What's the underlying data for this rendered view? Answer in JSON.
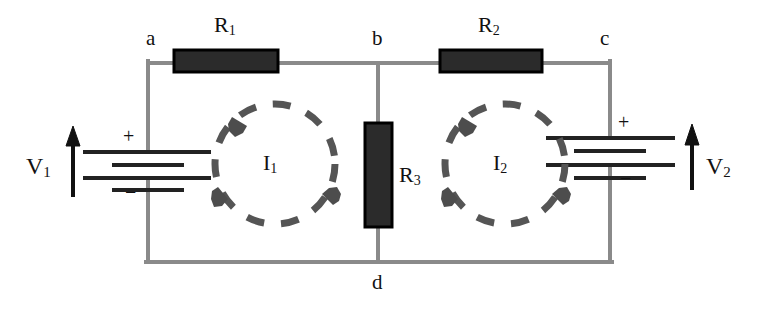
{
  "diagram": {
    "type": "circuit-schematic",
    "width": 762,
    "height": 316,
    "colors": {
      "background": "#ffffff",
      "wire": "#8a8a8a",
      "resistor_fill": "#262626",
      "resistor_stroke": "#000000",
      "loop_arrow": "#555555",
      "text": "#111111",
      "battery_plate": "#222222"
    }
  },
  "nodes": [
    {
      "id": "a",
      "label": "a",
      "x": 146,
      "y": 28
    },
    {
      "id": "b",
      "label": "b",
      "x": 372,
      "y": 28
    },
    {
      "id": "c",
      "label": "c",
      "x": 600,
      "y": 28
    },
    {
      "id": "d",
      "label": "d",
      "x": 372,
      "y": 272
    }
  ],
  "resistors": [
    {
      "id": "R1",
      "label": "R",
      "subscript": "1",
      "orientation": "horizontal",
      "x": 174,
      "y": 50,
      "w": 104,
      "h": 22,
      "label_x": 214,
      "label_y": 14
    },
    {
      "id": "R2",
      "label": "R",
      "subscript": "2",
      "orientation": "horizontal",
      "x": 440,
      "y": 50,
      "w": 102,
      "h": 22,
      "label_x": 478,
      "label_y": 14
    },
    {
      "id": "R3",
      "label": "R",
      "subscript": "3",
      "orientation": "vertical",
      "x": 365,
      "y": 123,
      "w": 27,
      "h": 104,
      "label_x": 399,
      "label_y": 164
    }
  ],
  "sources": [
    {
      "id": "V1",
      "label": "V",
      "subscript": "1",
      "plus": "+",
      "minus": "−",
      "label_x": 26,
      "label_y": 154,
      "arrow_x": 73,
      "arrow_top": 130,
      "arrow_bottom": 197,
      "plus_x": 123,
      "plus_y": 128,
      "minus_x": 125,
      "minus_y": 182,
      "terminal_x": 148
    },
    {
      "id": "V2",
      "label": "V",
      "subscript": "2",
      "plus": "+",
      "minus": "−",
      "label_x": 706,
      "label_y": 154,
      "arrow_x": 692,
      "arrow_top": 126,
      "arrow_bottom": 190,
      "plus_x": 620,
      "plus_y": 114,
      "minus_x": 622,
      "minus_y": 168,
      "terminal_x": 610
    }
  ],
  "loops": [
    {
      "id": "I1",
      "label": "I",
      "subscript": "1",
      "cx": 275,
      "cy": 164,
      "r": 60,
      "direction": "clockwise",
      "label_x": 263,
      "label_y": 152
    },
    {
      "id": "I2",
      "label": "I",
      "subscript": "2",
      "cx": 505,
      "cy": 164,
      "r": 60,
      "direction": "clockwise",
      "label_x": 493,
      "label_y": 152
    }
  ],
  "wires": {
    "top_y": 63,
    "bottom_y": 262,
    "left_x": 148,
    "right_x": 610,
    "middle_x": 378
  }
}
